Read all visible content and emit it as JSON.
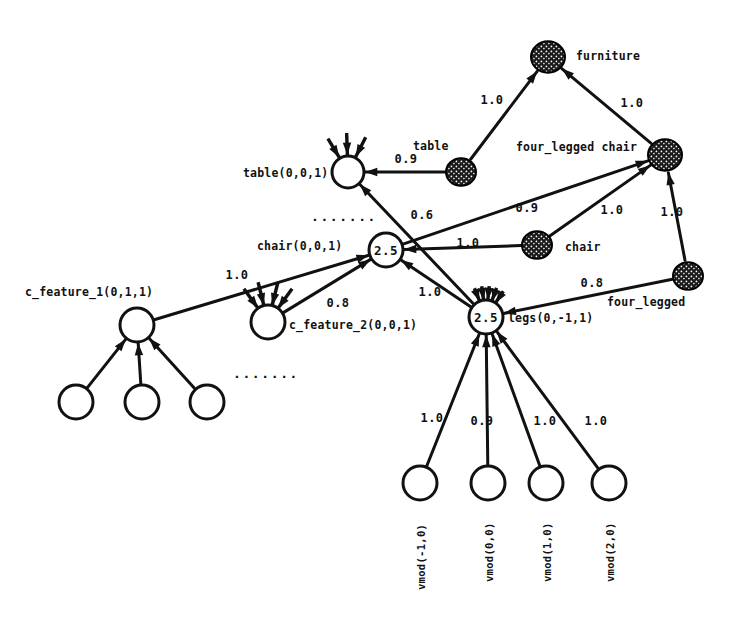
{
  "diagram": {
    "colors": {
      "ink": "#111111",
      "filled_node": "#1a1a1a",
      "background": "#ffffff"
    },
    "nodes": [
      {
        "id": "furniture",
        "label": "furniture",
        "value": "",
        "style": "filled",
        "cx": 548,
        "cy": 57,
        "r": 17,
        "label_x": 576,
        "label_y": 49
      },
      {
        "id": "table_concept",
        "label": "table",
        "value": "",
        "style": "filled",
        "cx": 461,
        "cy": 172,
        "r": 15,
        "label_x": 413,
        "label_y": 139
      },
      {
        "id": "four_legged_chair",
        "label": "four_legged chair",
        "value": "",
        "style": "filled",
        "cx": 665,
        "cy": 155,
        "r": 17,
        "label_x": 516,
        "label_y": 140
      },
      {
        "id": "chair_concept",
        "label": "chair",
        "value": "",
        "style": "filled",
        "cx": 537,
        "cy": 245,
        "r": 15,
        "label_x": 565,
        "label_y": 240
      },
      {
        "id": "four_legged",
        "label": "four_legged",
        "value": "",
        "style": "filled",
        "cx": 688,
        "cy": 276,
        "r": 15,
        "label_x": 607,
        "label_y": 295
      },
      {
        "id": "table_instance",
        "label": "table(0,0,1)",
        "value": "",
        "style": "open",
        "cx": 348,
        "cy": 172,
        "r": 16,
        "label_x": 243,
        "label_y": 166
      },
      {
        "id": "chair_instance",
        "label": "chair(0,0,1)",
        "value": "2.5",
        "style": "open",
        "cx": 386,
        "cy": 250,
        "r": 17,
        "label_x": 257,
        "label_y": 239
      },
      {
        "id": "legs_instance",
        "label": "legs(0,-1,1)",
        "value": "2.5",
        "style": "open",
        "cx": 486,
        "cy": 317,
        "r": 17,
        "label_x": 508,
        "label_y": 311
      },
      {
        "id": "c_feature_1",
        "label": "c_feature_1(0,1,1)",
        "value": "",
        "style": "open",
        "cx": 137,
        "cy": 325,
        "r": 17,
        "label_x": 25,
        "label_y": 285
      },
      {
        "id": "c_feature_2",
        "label": "c_feature_2(0,0,1)",
        "value": "",
        "style": "open",
        "cx": 268,
        "cy": 322,
        "r": 17,
        "label_x": 289,
        "label_y": 318
      },
      {
        "id": "cf1_child_1",
        "label": "",
        "value": "",
        "style": "open",
        "cx": 76,
        "cy": 402,
        "r": 17,
        "label_x": 0,
        "label_y": 0
      },
      {
        "id": "cf1_child_2",
        "label": "",
        "value": "",
        "style": "open",
        "cx": 142,
        "cy": 402,
        "r": 17,
        "label_x": 0,
        "label_y": 0
      },
      {
        "id": "cf1_child_3",
        "label": "",
        "value": "",
        "style": "open",
        "cx": 207,
        "cy": 402,
        "r": 17,
        "label_x": 0,
        "label_y": 0
      },
      {
        "id": "vmod_m1",
        "label": "vmod(-1,0)",
        "value": "",
        "style": "open",
        "cx": 420,
        "cy": 483,
        "r": 17,
        "label_x": 0,
        "label_y": 0
      },
      {
        "id": "vmod_0",
        "label": "vmod(0,0)",
        "value": "",
        "style": "open",
        "cx": 488,
        "cy": 483,
        "r": 17,
        "label_x": 0,
        "label_y": 0
      },
      {
        "id": "vmod_1",
        "label": "vmod(1,0)",
        "value": "",
        "style": "open",
        "cx": 546,
        "cy": 483,
        "r": 17,
        "label_x": 0,
        "label_y": 0
      },
      {
        "id": "vmod_2",
        "label": "vmod(2,0)",
        "value": "",
        "style": "open",
        "cx": 609,
        "cy": 483,
        "r": 17,
        "label_x": 0,
        "label_y": 0
      }
    ],
    "vertical_labels": [
      {
        "id": "vmod_m1_label",
        "text": "vmod(-1,0)",
        "x": 415,
        "y": 590
      },
      {
        "id": "vmod_0_label",
        "text": "vmod(0,0)",
        "x": 483,
        "y": 582
      },
      {
        "id": "vmod_1_label",
        "text": "vmod(1,0)",
        "x": 541,
        "y": 582
      },
      {
        "id": "vmod_2_label",
        "text": "vmod(2,0)",
        "x": 604,
        "y": 582
      }
    ],
    "edges": [
      {
        "id": "e-furniture-table",
        "from": "table_concept",
        "to": "furniture",
        "weight": "1.0",
        "lx": 492,
        "ly": 100
      },
      {
        "id": "e-furniture-flc",
        "from": "four_legged_chair",
        "to": "furniture",
        "weight": "1.0",
        "lx": 632,
        "ly": 103
      },
      {
        "id": "e-tableinst-table",
        "from": "table_concept",
        "to": "table_instance",
        "weight": "0.9",
        "lx": 406,
        "ly": 159
      },
      {
        "id": "e-chairinst-flc",
        "from": "chair_instance",
        "to": "four_legged_chair",
        "weight": "0.9",
        "lx": 527,
        "ly": 208
      },
      {
        "id": "e-chairconcept-flc",
        "from": "chair_concept",
        "to": "four_legged_chair",
        "weight": "1.0",
        "lx": 612,
        "ly": 210
      },
      {
        "id": "e-fourlegged-flc",
        "from": "four_legged",
        "to": "four_legged_chair",
        "weight": "1.0",
        "lx": 672,
        "ly": 212
      },
      {
        "id": "e-chairconcept-chairinst",
        "from": "chair_concept",
        "to": "chair_instance",
        "weight": "1.0",
        "lx": 468,
        "ly": 243
      },
      {
        "id": "e-tableinst-legs",
        "from": "legs_instance",
        "to": "table_instance",
        "weight": "0.6",
        "lx": 422,
        "ly": 215
      },
      {
        "id": "e-legs-fourlegged",
        "from": "four_legged",
        "to": "legs_instance",
        "weight": "0.8",
        "lx": 592,
        "ly": 283
      },
      {
        "id": "e-legs-chairinst",
        "from": "legs_instance",
        "to": "chair_instance",
        "weight": "1.0",
        "lx": 430,
        "ly": 292
      },
      {
        "id": "e-cf1-chairinst",
        "from": "c_feature_1",
        "to": "chair_instance",
        "weight": "1.0",
        "lx": 237,
        "ly": 275
      },
      {
        "id": "e-cf2-chairinst",
        "from": "c_feature_2",
        "to": "chair_instance",
        "weight": "0.8",
        "lx": 338,
        "ly": 303
      },
      {
        "id": "e-cf1child1-cf1",
        "from": "cf1_child_1",
        "to": "c_feature_1",
        "weight": "",
        "lx": 0,
        "ly": 0
      },
      {
        "id": "e-cf1child2-cf1",
        "from": "cf1_child_2",
        "to": "c_feature_1",
        "weight": "",
        "lx": 0,
        "ly": 0
      },
      {
        "id": "e-cf1child3-cf1",
        "from": "cf1_child_3",
        "to": "c_feature_1",
        "weight": "",
        "lx": 0,
        "ly": 0
      },
      {
        "id": "e-vmodm1-legs",
        "from": "vmod_m1",
        "to": "legs_instance",
        "weight": "1.0",
        "lx": 432,
        "ly": 418
      },
      {
        "id": "e-vmod0-legs",
        "from": "vmod_0",
        "to": "legs_instance",
        "weight": "0.9",
        "lx": 482,
        "ly": 421
      },
      {
        "id": "e-vmod1-legs",
        "from": "vmod_1",
        "to": "legs_instance",
        "weight": "1.0",
        "lx": 545,
        "ly": 421
      },
      {
        "id": "e-vmod2-legs",
        "from": "vmod_2",
        "to": "legs_instance",
        "weight": "1.0",
        "lx": 596,
        "ly": 421
      }
    ],
    "stub_groups": [
      {
        "id": "table-instance-stubs",
        "cx": 348,
        "cy": 172,
        "count": 3,
        "angles": [
          239,
          268,
          297
        ],
        "len": 22
      },
      {
        "id": "c-feature-2-stubs",
        "cx": 268,
        "cy": 322,
        "count": 4,
        "angles": [
          234,
          256,
          284,
          306
        ],
        "len": 24
      },
      {
        "id": "legs-instance-stubs",
        "cx": 486,
        "cy": 317,
        "count": 5,
        "angles": [
          248,
          262,
          276,
          290,
          304
        ],
        "len": 14
      }
    ],
    "ellipses": [
      {
        "id": "table-instance-ellipsis",
        "text": ".......",
        "x": 344,
        "y": 216
      },
      {
        "id": "c-feature-2-ellipsis",
        "text": ".......",
        "x": 266,
        "y": 373
      }
    ]
  }
}
